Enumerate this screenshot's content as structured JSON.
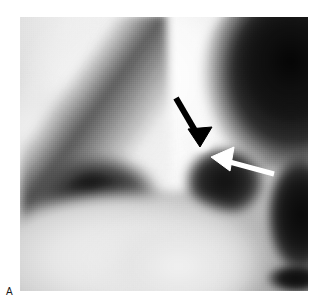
{
  "figure": {
    "panel_label": "A",
    "modality": "grayscale-radiology-scan",
    "image_frame": {
      "left_px": 20,
      "top_px": 17,
      "width_px": 288,
      "height_px": 274,
      "background_hex": "#9a9a9a"
    },
    "annotations": [
      {
        "id": "black-arrow",
        "kind": "arrow",
        "color_hex": "#000000",
        "direction": "down-right",
        "tail_x": 176,
        "tail_y": 98,
        "tip_x": 200,
        "tip_y": 144,
        "label": "black arrow"
      },
      {
        "id": "white-arrow",
        "kind": "arrow",
        "color_hex": "#ffffff",
        "direction": "left",
        "tail_x": 272,
        "tail_y": 172,
        "tip_x": 211,
        "tip_y": 155,
        "label": "white arrow"
      }
    ]
  }
}
